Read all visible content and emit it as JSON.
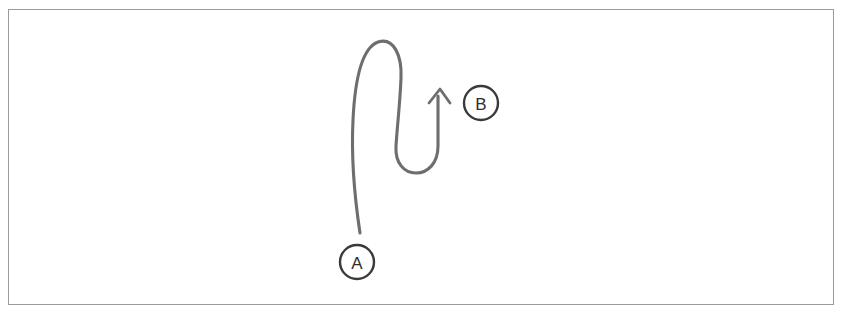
{
  "figure": {
    "background_color": "#ffffff",
    "border_color": "#9b9b9b",
    "stroke_color": "#6e6e6e",
    "node_stroke_color": "#3a3a3a",
    "label_color": "#2e2e2e"
  },
  "nodes": [
    {
      "id": "A",
      "label": "A",
      "role": "start",
      "cx": 357,
      "cy": 262,
      "r": 17
    },
    {
      "id": "B",
      "label": "B",
      "role": "end",
      "cx": 481,
      "cy": 103,
      "r": 17
    }
  ],
  "path": {
    "name": "route-a-to-b",
    "direction": "A to B",
    "has_arrowhead": true,
    "arrow_tip": {
      "x": 440,
      "y": 89
    },
    "description": "Curve rises from A, arcs over to the right, descends, makes a U-turn at the bottom, then rises to the arrowhead beside B",
    "d": "M 360 233 C 355 200 351 160 353 120 C 355 78 362 48 378 42 C 394 37 402 56 401 78 C 400 104 397 128 396 146 C 395 163 404 173 416 173 C 428 173 438 163 438 146 L 438 96",
    "arrow_d": "M 429 103 L 440 89 L 450 103"
  }
}
